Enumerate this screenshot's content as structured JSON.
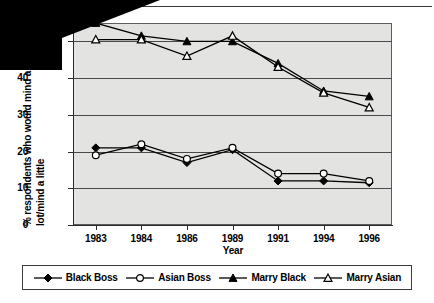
{
  "chart_data": {
    "type": "line",
    "title": "",
    "xlabel": "Year",
    "ylabel_line1": "% respondents who would mind a",
    "ylabel_line2": "lot/mind a little",
    "categories": [
      "1983",
      "1984",
      "1986",
      "1989",
      "1991",
      "1994",
      "1996"
    ],
    "ylim": [
      0,
      55
    ],
    "yticks": [
      "0",
      "10",
      "20",
      "30",
      "40",
      "50"
    ],
    "ytick_values": [
      0,
      10,
      20,
      30,
      40,
      50
    ],
    "grid": true,
    "legend_position": "bottom",
    "series": [
      {
        "name": "Black Boss",
        "marker": "filled-diamond",
        "values": [
          21,
          21,
          17,
          20.5,
          12,
          12,
          11.5
        ]
      },
      {
        "name": "Asian Boss",
        "marker": "open-circle",
        "values": [
          19,
          22,
          18,
          21,
          14,
          14,
          12
        ]
      },
      {
        "name": "Marry Black",
        "marker": "filled-triangle",
        "values": [
          55,
          51.5,
          50,
          50,
          44,
          36.5,
          35
        ]
      },
      {
        "name": "Marry Asian",
        "marker": "open-triangle",
        "values": [
          50.5,
          50.5,
          46,
          51.5,
          43,
          36,
          32
        ]
      }
    ]
  },
  "legend": {
    "items": [
      {
        "label": "Black Boss",
        "marker": "filled-diamond"
      },
      {
        "label": "Asian Boss",
        "marker": "open-circle"
      },
      {
        "label": "Marry Black",
        "marker": "filled-triangle"
      },
      {
        "label": "Marry Asian",
        "marker": "open-triangle"
      }
    ]
  },
  "colors": {
    "plot_background": "#e3e3e1",
    "line": "#000000",
    "gridline": "#4a4a4a",
    "axis": "#2c2c2c"
  }
}
